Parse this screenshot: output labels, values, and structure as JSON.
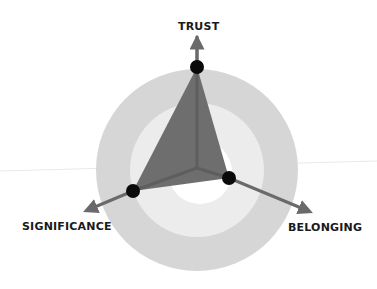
{
  "diagram": {
    "type": "radar-triangle",
    "labels": {
      "top": "TRUST",
      "left": "SIGNIFICANCE",
      "right": "BELONGING"
    },
    "center": [
      197,
      168
    ],
    "rings": [
      {
        "name": "outer-ring",
        "radius": 101,
        "color": "#d6d6d6"
      },
      {
        "name": "middle-ring",
        "radius": 67,
        "color": "#ececec"
      },
      {
        "name": "inner-ring",
        "radius": 33,
        "color": "#ffffff"
      }
    ],
    "points": [
      {
        "axis": "TRUST",
        "x": 197,
        "y": 67
      },
      {
        "axis": "SIGNIFICANCE",
        "x": 133,
        "y": 191
      },
      {
        "axis": "BELONGING",
        "x": 229,
        "y": 178
      }
    ],
    "arrow_tips": [
      {
        "axis": "TRUST",
        "x": 197,
        "y": 36
      },
      {
        "axis": "SIGNIFICANCE",
        "x": 83,
        "y": 212
      },
      {
        "axis": "BELONGING",
        "x": 313,
        "y": 213
      }
    ],
    "colors": {
      "polygon_fill": "#6e6e6e",
      "axis_line": "#5e5e5e",
      "arrow": "#6a6a6a",
      "dot": "#0a0a0a",
      "label": "#1a1a1a"
    }
  }
}
